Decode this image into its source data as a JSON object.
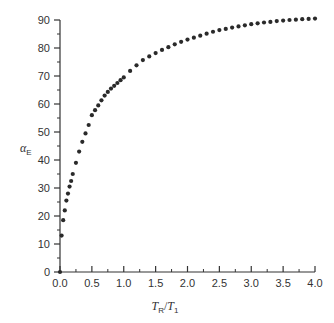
{
  "chart_data": {
    "type": "scatter",
    "title": "",
    "xlabel": "T_R/T_1",
    "xlabel_parts": {
      "a": "T",
      "a_sub": "R",
      "slash": "/",
      "b": "T",
      "b_sub": "1"
    },
    "ylabel": "α_E",
    "ylabel_parts": {
      "main": "α",
      "sub": "E"
    },
    "xlim": [
      0.0,
      4.0
    ],
    "ylim": [
      0,
      90
    ],
    "x_ticks": [
      "0.0",
      "0.5",
      "1.0",
      "1.5",
      "2.0",
      "2.5",
      "3.0",
      "3.5",
      "4.0"
    ],
    "y_ticks": [
      "0",
      "10",
      "20",
      "30",
      "40",
      "50",
      "60",
      "70",
      "80",
      "90"
    ],
    "grid": false,
    "legend": null,
    "marker_color": "#2a2a2a",
    "axis_color": "#333333",
    "x": [
      0.0,
      0.025,
      0.05,
      0.075,
      0.1,
      0.125,
      0.15,
      0.175,
      0.2,
      0.25,
      0.3,
      0.35,
      0.4,
      0.45,
      0.5,
      0.55,
      0.6,
      0.65,
      0.7,
      0.75,
      0.8,
      0.85,
      0.9,
      0.95,
      1.0,
      1.1,
      1.2,
      1.3,
      1.4,
      1.5,
      1.6,
      1.7,
      1.8,
      1.9,
      2.0,
      2.1,
      2.2,
      2.3,
      2.4,
      2.5,
      2.6,
      2.7,
      2.8,
      2.9,
      3.0,
      3.1,
      3.2,
      3.3,
      3.4,
      3.5,
      3.6,
      3.7,
      3.8,
      3.9,
      4.0
    ],
    "y": [
      0,
      13,
      18.5,
      22,
      25.5,
      28,
      30.5,
      32.5,
      35,
      39,
      43,
      46.5,
      49.5,
      52.5,
      56,
      57.8,
      59.5,
      61.3,
      63,
      64.3,
      65.5,
      66.5,
      67.5,
      68.5,
      69.5,
      71.8,
      73.8,
      75.7,
      77,
      78.2,
      79.3,
      80.3,
      81.3,
      82.2,
      83,
      83.7,
      84.4,
      85.1,
      85.8,
      86.4,
      86.8,
      87.3,
      87.7,
      88.1,
      88.5,
      88.8,
      89.1,
      89.3,
      89.6,
      89.8,
      90,
      90.1,
      90.3,
      90.4,
      90.5
    ]
  }
}
